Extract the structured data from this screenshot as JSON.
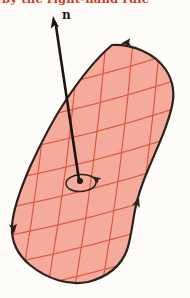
{
  "figure": {
    "caption": "by the right-hand rule",
    "normal_vector_label": "n"
  },
  "colors": {
    "background": "#fdfcf8",
    "surface_fill": "#f5ab9b",
    "grid_line": "#dd5741",
    "outline": "#2b211c",
    "vector": "#1c1512",
    "caption_text": "#cf3b2c"
  }
}
